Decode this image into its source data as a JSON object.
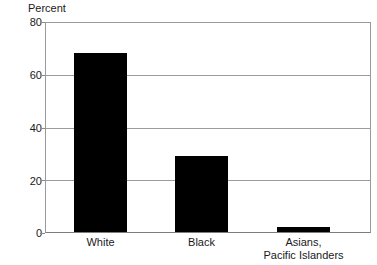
{
  "chart_data": {
    "type": "bar",
    "title": "",
    "subtitle": "",
    "xlabel": "",
    "ylabel": "Percent",
    "ylim": [
      0,
      80
    ],
    "yticks": [
      0,
      20,
      40,
      60,
      80
    ],
    "ytick_labels": [
      "0",
      "20",
      "40",
      "60",
      "80"
    ],
    "grid": true,
    "legend": "none",
    "bar_color": "#000000",
    "categories": [
      "White",
      "Black",
      "Asians, Pacific Islanders"
    ],
    "category_lines": [
      [
        "White"
      ],
      [
        "Black"
      ],
      [
        "Asians,",
        "Pacific Islanders"
      ]
    ],
    "values": [
      68,
      29,
      2
    ],
    "series": [
      {
        "name": "Percent",
        "values": [
          68,
          29,
          2
        ]
      }
    ]
  },
  "colors": {
    "bar": "#000000",
    "gridline": "#9c9c9c",
    "frame": "#9a9a9a",
    "text": "#1a1a1a",
    "background": "#ffffff"
  }
}
